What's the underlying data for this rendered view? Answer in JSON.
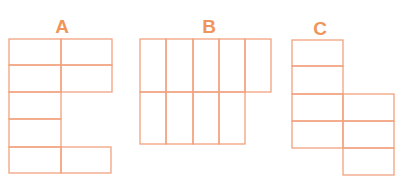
{
  "colors": {
    "stroke": "#F2A27E",
    "label": "#F0955A"
  },
  "figures": [
    {
      "label": "A",
      "label_x": 62,
      "label_y": 17
    },
    {
      "label": "B",
      "label_x": 209,
      "label_y": 17
    },
    {
      "label": "C",
      "label_x": 320,
      "label_y": 19
    }
  ]
}
